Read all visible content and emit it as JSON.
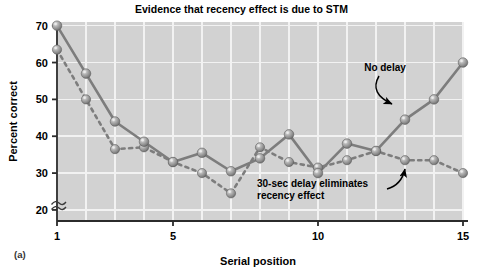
{
  "figure": {
    "panel_label": "(a)",
    "title": "Evidence that recency effect is due to STM"
  },
  "annotations": {
    "no_delay": "No delay",
    "delay_line1": "30-sec delay eliminates",
    "delay_line2": "recency effect"
  },
  "colors": {
    "plot_background": "#d2d2d2",
    "gridline": "#f2f2f2",
    "axis": "#2b2b2b",
    "marker": "#8c8c8c",
    "marker_highlight": "#d8d8d8",
    "line": "#7d7d7d",
    "text": "#000000",
    "page_background": "#ffffff"
  },
  "chart_data": {
    "type": "line",
    "title": "Evidence that recency effect is due to STM",
    "xlabel": "Serial position",
    "ylabel": "Percent correct",
    "xlim": [
      1,
      15
    ],
    "ylim": [
      17,
      71
    ],
    "yticks": [
      20,
      30,
      40,
      50,
      60,
      70
    ],
    "ytick_labels": [
      "20",
      "30",
      "40",
      "50",
      "60",
      "70"
    ],
    "xticks": [
      1,
      5,
      10,
      15
    ],
    "xtick_labels": [
      "1",
      "5",
      "10",
      "15"
    ],
    "grid": true,
    "grid_x_positions": [
      1,
      2,
      3,
      4,
      5,
      6,
      7,
      8,
      9,
      10,
      11,
      12,
      13,
      14,
      15
    ],
    "y_axis_break": true,
    "legend": "annotations-on-plot",
    "x": [
      1,
      2,
      3,
      4,
      5,
      6,
      7,
      8,
      9,
      10,
      11,
      12,
      13,
      14,
      15
    ],
    "series": [
      {
        "name": "No delay",
        "style": "solid",
        "values": [
          70.0,
          57.0,
          44.0,
          38.5,
          33.0,
          35.5,
          30.5,
          34.0,
          40.5,
          30.0,
          38.0,
          36.0,
          44.5,
          50.0,
          60.0
        ]
      },
      {
        "name": "30-sec delay eliminates recency effect",
        "style": "dotted",
        "values": [
          63.5,
          50.0,
          36.5,
          37.0,
          33.0,
          30.0,
          24.5,
          37.0,
          33.0,
          31.5,
          33.5,
          36.0,
          33.5,
          33.5,
          30.0
        ]
      }
    ]
  }
}
